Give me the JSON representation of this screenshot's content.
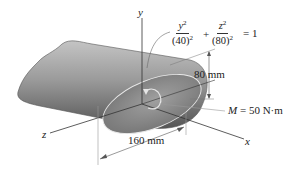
{
  "figure": {
    "type": "engineering-mechanics-diagram",
    "axes": {
      "x": "x",
      "y": "y",
      "z": "z"
    },
    "equation": {
      "term1_num": "y",
      "term1_num_exp": "2",
      "term1_den": "(40)",
      "term1_den_exp": "2",
      "plus": "+",
      "term2_num": "z",
      "term2_num_exp": "2",
      "term2_den": "(80)",
      "term2_den_exp": "2",
      "equals": "= 1"
    },
    "dimensions": {
      "height": "80 mm",
      "width": "160 mm"
    },
    "moment": {
      "symbol": "M",
      "value": "= 50 N·m"
    },
    "colors": {
      "body_dark": "#6e6e6e",
      "body_light": "#b5b5b5",
      "face": "#8a8a8a",
      "line": "#333333"
    }
  }
}
